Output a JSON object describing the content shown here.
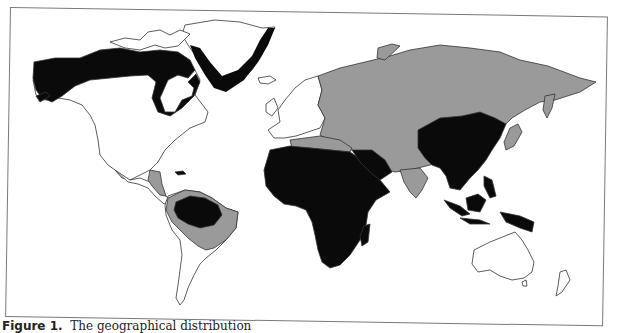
{
  "figure": {
    "label": "Figure 1.",
    "caption_text": "The geographical distribution",
    "colors": {
      "endemic": "#0a0a0a",
      "intermediate": "#9a9a9a",
      "low": "#ffffff",
      "outline": "#333333",
      "frame": "#7a7a7a"
    }
  },
  "map": {
    "type": "world-choropleth",
    "legend": [],
    "regions": [
      {
        "name": "Alaska / Northern Canada / Greenland coast",
        "shade": "endemic"
      },
      {
        "name": "North America (USA, southern Canada)",
        "shade": "low"
      },
      {
        "name": "Central America",
        "shade": "intermediate"
      },
      {
        "name": "Amazon basin",
        "shade": "endemic"
      },
      {
        "name": "South America (north and Brazil)",
        "shade": "intermediate"
      },
      {
        "name": "Southern South America",
        "shade": "low"
      },
      {
        "name": "Western Europe",
        "shade": "low"
      },
      {
        "name": "Eastern Europe / Mediterranean",
        "shade": "intermediate"
      },
      {
        "name": "Russia / Central Asia",
        "shade": "intermediate"
      },
      {
        "name": "Middle East / South Asia",
        "shade": "intermediate"
      },
      {
        "name": "Africa",
        "shade": "endemic"
      },
      {
        "name": "Arabian Peninsula",
        "shade": "endemic"
      },
      {
        "name": "China / Southeast Asia",
        "shade": "endemic"
      },
      {
        "name": "Indonesia / Philippines / Papua New Guinea",
        "shade": "endemic"
      },
      {
        "name": "Japan",
        "shade": "intermediate"
      },
      {
        "name": "Australia / New Zealand",
        "shade": "low"
      }
    ]
  }
}
